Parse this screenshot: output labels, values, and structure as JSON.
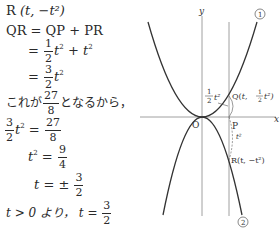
{
  "solution": {
    "line1": {
      "label": "R",
      "point": "(t, −t²)"
    },
    "line2": {
      "lhs": "QR",
      "rhs": "= QP + PR"
    },
    "line3": {
      "eq": "=",
      "frac_num": "1",
      "frac_den": "2",
      "term1": "t",
      "plus": "+ t",
      "exp": "2"
    },
    "line4": {
      "eq": "=",
      "frac_num": "3",
      "frac_den": "2",
      "term": "t",
      "exp": "2"
    },
    "line5": {
      "pre": "これが",
      "frac_num": "27",
      "frac_den": "8",
      "post": "となるから，"
    },
    "line6": {
      "frac_num": "3",
      "frac_den": "2",
      "term": "t",
      "exp": "2",
      "eq": "=",
      "rhs_num": "27",
      "rhs_den": "8"
    },
    "line7": {
      "term": "t",
      "exp": "2",
      "eq": "=",
      "rhs_num": "9",
      "rhs_den": "4"
    },
    "line8": {
      "term": "t",
      "eq": "= ±",
      "rhs_num": "3",
      "rhs_den": "2"
    },
    "line9": {
      "cond": "t > 0 より，",
      "term": "t",
      "eq": "=",
      "rhs_num": "3",
      "rhs_den": "2"
    }
  },
  "graph": {
    "y_axis_label": "y",
    "x_axis_label": "x",
    "origin_label": "O",
    "curve1_label": "①",
    "curve2_label": "②",
    "point_q_label": "Q(t, ½t²)",
    "point_p_label": "P",
    "point_r_label": "R(t, −t²)",
    "qp_length_label": "½t²",
    "pr_length_label": "t²",
    "curve1_equation": "y = ½x²",
    "curve2_equation": "y = −x²",
    "line_color": "#333333",
    "axis_color": "#888888"
  }
}
